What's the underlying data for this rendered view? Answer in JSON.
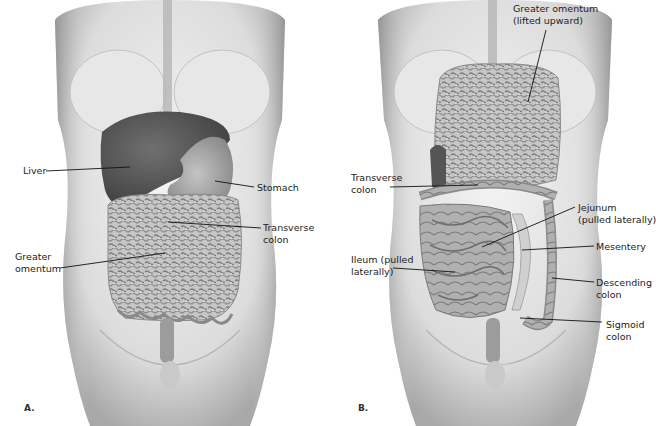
{
  "figure": {
    "colors": {
      "background": "#ffffff",
      "skin_light": "#eeeeee",
      "skin_mid": "#cfcfcf",
      "skin_dark": "#9a9a9a",
      "liver": "#5c5c5c",
      "stomach": "#a9a9a9",
      "omentum": "#bdbdbd",
      "omentum_texture": "#7d7d7d",
      "intestine": "#a6a6a6",
      "leader_line": "#111111",
      "text": "#222222"
    },
    "panels": [
      {
        "letter": "A.",
        "labels": [
          {
            "text": "Liver",
            "x": 23,
            "y": 165
          },
          {
            "text": "Stomach",
            "x": 257,
            "y": 182
          },
          {
            "text": "Transverse\ncolon",
            "x": 263,
            "y": 222
          },
          {
            "text": "Greater\nomentum",
            "x": 15,
            "y": 251
          }
        ]
      },
      {
        "letter": "B.",
        "labels": [
          {
            "text": "Greater omentum\n(lifted upward)",
            "x": 513,
            "y": 3
          },
          {
            "text": "Transverse\ncolon",
            "x": 351,
            "y": 172
          },
          {
            "text": "Jejunum\n(pulled laterally)",
            "x": 578,
            "y": 202
          },
          {
            "text": "Mesentery",
            "x": 596,
            "y": 241
          },
          {
            "text": "Ileum (pulled\nlaterally)",
            "x": 351,
            "y": 254
          },
          {
            "text": "Descending\ncolon",
            "x": 596,
            "y": 277
          },
          {
            "text": "Sigmoid\ncolon",
            "x": 606,
            "y": 319
          }
        ]
      }
    ]
  }
}
